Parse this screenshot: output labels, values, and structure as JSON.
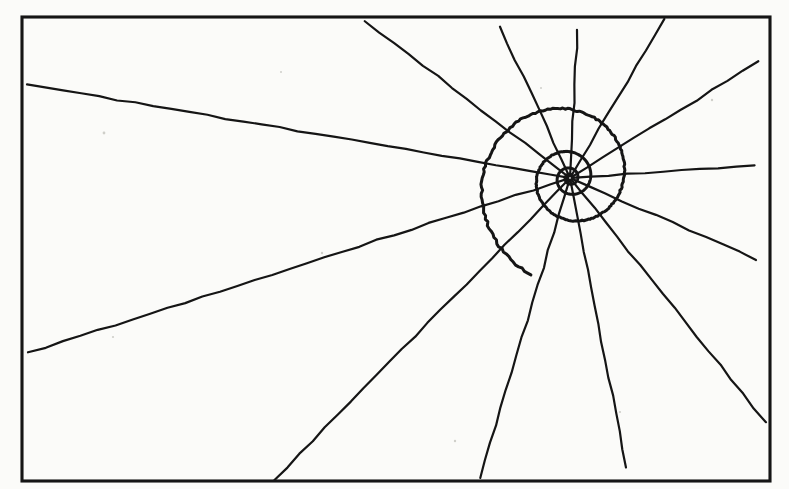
{
  "figure": {
    "medium": "black ink line drawing on off-white paper",
    "background_color": "#fbfbf9",
    "ink_color": "#151515"
  },
  "canvas": {
    "width": 789,
    "height": 489
  },
  "frame": {
    "label": "border rectangle",
    "x": 22,
    "y": 17,
    "width": 748,
    "height": 464,
    "stroke_width": 3.1,
    "color": "#151515"
  },
  "pole": {
    "label": "spiral pole / radial convergence point",
    "x": 570,
    "y": 178
  },
  "spiral": {
    "label": "logarithmic spiral",
    "type": "logarithmic",
    "handedness": "counterclockwise-outward",
    "growth_per_turn": 2.62,
    "start_radius": 3.0,
    "start_angle_deg": -48,
    "end_angle_deg": 1330,
    "angle_step_deg": 2,
    "stroke_width": 3.0,
    "measured_radii_up": [
      10,
      23,
      58,
      156
    ],
    "measured_radii_left": [
      50,
      110,
      198
    ],
    "measured_radii_right": [
      22,
      42,
      67
    ]
  },
  "radials": {
    "label": "radial rays",
    "count": 13,
    "angle_step_deg": 27.7,
    "first_angle_deg": 4,
    "inner_radius": 2,
    "outer_radius": 1100,
    "stroke_width": 2.2
  },
  "paper_specks": [
    {
      "x": 104,
      "y": 133,
      "r": 1.4
    },
    {
      "x": 113,
      "y": 337,
      "r": 1.1
    },
    {
      "x": 322,
      "y": 253,
      "r": 1.2
    },
    {
      "x": 541,
      "y": 88,
      "r": 1.0
    },
    {
      "x": 712,
      "y": 100,
      "r": 1.2
    },
    {
      "x": 620,
      "y": 412,
      "r": 1.1
    },
    {
      "x": 281,
      "y": 72,
      "r": 1.0
    },
    {
      "x": 455,
      "y": 441,
      "r": 1.2
    }
  ]
}
